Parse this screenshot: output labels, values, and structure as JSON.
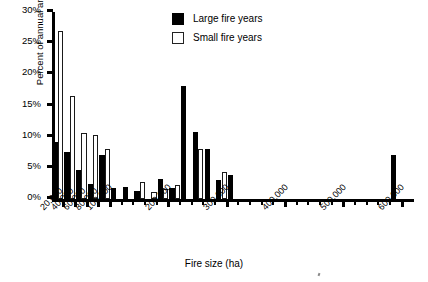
{
  "chart_data": {
    "type": "bar",
    "title": "",
    "xlabel": "Fire size (ha)",
    "ylabel": "Percent of annual area burned",
    "ylim": [
      0,
      30
    ],
    "yticks": [
      0,
      5,
      10,
      15,
      20,
      25,
      30
    ],
    "ytick_labels": [
      "0%",
      "5%",
      "10%",
      "15%",
      "20%",
      "25%",
      "30%"
    ],
    "xlim": [
      0,
      620000
    ],
    "xticks": [
      20000,
      40000,
      60000,
      80000,
      100000,
      200000,
      300000,
      400000,
      500000,
      600000
    ],
    "xtick_labels": [
      "20,000",
      "40,000",
      "60,000",
      "80,000",
      "100,000",
      "200,000",
      "300,000",
      "400,000",
      "500,000",
      "600,000"
    ],
    "grid": false,
    "legend_position": "top-center",
    "bin_width": 20000,
    "categories": [
      "0-20,000",
      "20,000-40,000",
      "40,000-60,000",
      "60,000-80,000",
      "80,000-100,000",
      "100,000-120,000",
      "120,000-140,000",
      "140,000-160,000",
      "160,000-180,000",
      "180,000-200,000",
      "200,000-220,000",
      "220,000-240,000",
      "240,000-260,000",
      "260,000-280,000",
      "280,000-300,000",
      "300,000-320,000",
      "320,000-340,000",
      "340,000-360,000",
      "360,000-380,000",
      "380,000-400,000",
      "400,000-420,000",
      "420,000-440,000",
      "440,000-460,000",
      "460,000-480,000",
      "480,000-500,000",
      "500,000-520,000",
      "520,000-540,000",
      "540,000-560,000",
      "560,000-580,000",
      "580,000-600,000"
    ],
    "series": [
      {
        "name": "Large fire years",
        "color": "#000000",
        "values": [
          9.2,
          7.5,
          4.7,
          2.4,
          7.0,
          1.7,
          2.0,
          1.3,
          0.0,
          3.2,
          1.8,
          18.2,
          10.7,
          8.0,
          3.0,
          3.8,
          0.0,
          0.0,
          0.0,
          0.0,
          0.0,
          0.0,
          0.0,
          0.0,
          0.0,
          0.0,
          0.0,
          0.0,
          0.0,
          7.0
        ]
      },
      {
        "name": "Small fire years",
        "color": "#ffffff",
        "values": [
          27.0,
          16.6,
          10.6,
          10.2,
          8.1,
          0.0,
          0.0,
          2.8,
          1.2,
          1.6,
          2.2,
          0.0,
          8.0,
          0.0,
          4.4,
          0.0,
          0.0,
          0.0,
          0.0,
          0.0,
          0.0,
          0.0,
          0.0,
          0.0,
          0.0,
          0.0,
          0.0,
          0.0,
          0.0,
          0.0
        ]
      }
    ]
  },
  "axis": {
    "y_title": "Percent of annual area burned",
    "x_title": "Fire size (ha)",
    "y_labels": [
      "30%",
      "25%",
      "20%",
      "15%",
      "10%",
      "5%",
      "0%"
    ],
    "x_labels": [
      "20,000",
      "40,000",
      "60,000",
      "80,000",
      "100,000",
      "200,000",
      "300,000",
      "400,000",
      "500,000",
      "600,000"
    ]
  },
  "legend": {
    "items": [
      {
        "label": "Large fire years",
        "style": "filled-black",
        "swatch": "large-fire-swatch"
      },
      {
        "label": "Small fire years",
        "style": "outlined-white",
        "swatch": "small-fire-swatch"
      }
    ]
  }
}
